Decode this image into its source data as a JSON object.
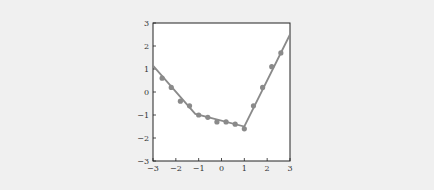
{
  "chart_data": {
    "type": "scatter",
    "title": "",
    "xlabel": "",
    "ylabel": "",
    "xlim": [
      -3,
      3
    ],
    "ylim": [
      -3,
      3
    ],
    "grid": false,
    "xticks": [
      "−3",
      "−2",
      "−1",
      "0",
      "1",
      "2",
      "3"
    ],
    "yticks": [
      "3",
      "2",
      "1",
      "0",
      "−1",
      "−2",
      "−3"
    ],
    "series": [
      {
        "name": "data points",
        "kind": "scatter",
        "color": "#8a8a8a",
        "x": [
          -2.6,
          -2.2,
          -1.8,
          -1.4,
          -1.0,
          -0.6,
          -0.2,
          0.2,
          0.6,
          1.0,
          1.4,
          1.8,
          2.2,
          2.6
        ],
        "y": [
          0.6,
          0.2,
          -0.4,
          -0.6,
          -1.0,
          -1.1,
          -1.3,
          -1.3,
          -1.4,
          -1.6,
          -0.6,
          0.2,
          1.1,
          1.7
        ]
      },
      {
        "name": "piecewise linear fit",
        "kind": "line",
        "color": "#8a8a8a",
        "x": [
          -3,
          -1.15,
          1.0,
          3
        ],
        "y": [
          1.15,
          -0.95,
          -1.5,
          2.5
        ]
      }
    ]
  }
}
